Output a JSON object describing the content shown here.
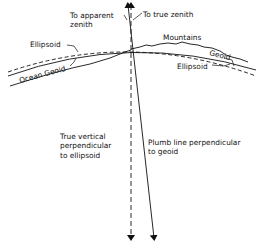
{
  "diagram": {
    "type": "geodesy-vertical-deflection",
    "labels": {
      "apparent_zenith_line1": "To apparent",
      "apparent_zenith_line2": "zenith",
      "true_zenith": "To true zenith",
      "mountains": "Mountains",
      "ellipsoid_left": "Ellipsoid",
      "ocean_geoid": "Ocean Geoid",
      "geoid_right": "Geoid",
      "ellipsoid_right": "Ellipsoid",
      "true_vertical_line1": "True vertical",
      "true_vertical_line2": "perpendicular",
      "true_vertical_line3": "to ellipsoid",
      "plumb_line_line1": "Plumb line perpendicular",
      "plumb_line_line2": "to geoid"
    },
    "lines": {
      "true_vertical": {
        "style": "dashed",
        "meaning": "perpendicular to ellipsoid"
      },
      "plumb_line": {
        "style": "solid",
        "meaning": "perpendicular to geoid"
      },
      "ellipsoid": {
        "style": "dashed"
      },
      "geoid": {
        "style": "solid"
      }
    },
    "colors": {
      "ink": "#111111",
      "background": "#ffffff"
    }
  }
}
